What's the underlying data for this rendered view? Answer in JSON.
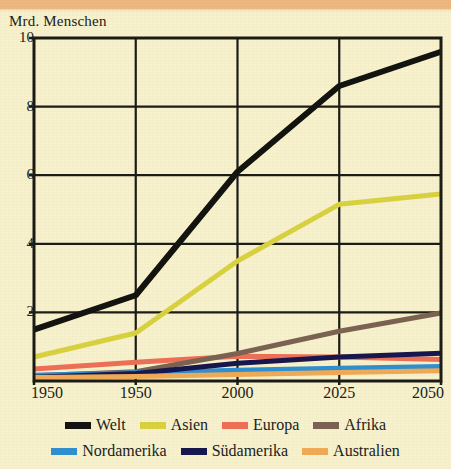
{
  "figure": {
    "background_color": "#f7f2cd",
    "top_band_color": "#eeb780",
    "axis_color": "#1a1a16"
  },
  "chart_data": {
    "type": "line",
    "title": "Mrd. Menschen",
    "subtitle": "",
    "xlabel": "",
    "ylabel": "Mrd. Menschen",
    "x": [
      1950,
      1975,
      2000,
      2025,
      2050
    ],
    "xtick_labels": [
      "1950",
      "1950",
      "2000",
      "2025",
      "2050"
    ],
    "ytick_labels": [
      "10",
      "8",
      "6",
      "4",
      "2"
    ],
    "ytick_values": [
      10,
      8,
      6,
      4,
      2
    ],
    "xlim": [
      1950,
      2050
    ],
    "ylim": [
      0,
      10
    ],
    "grid": true,
    "grid_axis": "both",
    "legend_position": "bottom",
    "legend_columns": 4,
    "series": [
      {
        "name": "Welt",
        "color": "#12120f",
        "width": 6.0,
        "values": [
          1.5,
          2.5,
          6.1,
          8.6,
          9.6
        ]
      },
      {
        "name": "Asien",
        "color": "#d9d23f",
        "width": 5.0,
        "values": [
          0.7,
          1.4,
          3.5,
          5.15,
          5.45
        ]
      },
      {
        "name": "Europa",
        "color": "#ee6f56",
        "width": 5.0,
        "values": [
          0.35,
          0.55,
          0.72,
          0.7,
          0.63
        ]
      },
      {
        "name": "Afrika",
        "color": "#7b6252",
        "width": 5.0,
        "values": [
          0.15,
          0.27,
          0.8,
          1.45,
          1.98
        ]
      },
      {
        "name": "Nordamerika",
        "color": "#2e8fd2",
        "width": 5.0,
        "values": [
          0.17,
          0.24,
          0.31,
          0.37,
          0.42
        ]
      },
      {
        "name": "Südamerika",
        "color": "#16164e",
        "width": 5.0,
        "values": [
          0.11,
          0.22,
          0.52,
          0.7,
          0.81
        ]
      },
      {
        "name": "Australien",
        "color": "#f0aa55",
        "width": 5.0,
        "values": [
          0.1,
          0.13,
          0.19,
          0.25,
          0.3
        ]
      }
    ]
  },
  "legend": {
    "row1": [
      {
        "label": "Welt",
        "color": "#12120f"
      },
      {
        "label": "Asien",
        "color": "#d9d23f"
      },
      {
        "label": "Europa",
        "color": "#ee6f56"
      },
      {
        "label": "Afrika",
        "color": "#7b6252"
      }
    ],
    "row2": [
      {
        "label": "Nordamerika",
        "color": "#2e8fd2"
      },
      {
        "label": "Südamerika",
        "color": "#16164e"
      },
      {
        "label": "Australien",
        "color": "#f0aa55"
      }
    ]
  }
}
